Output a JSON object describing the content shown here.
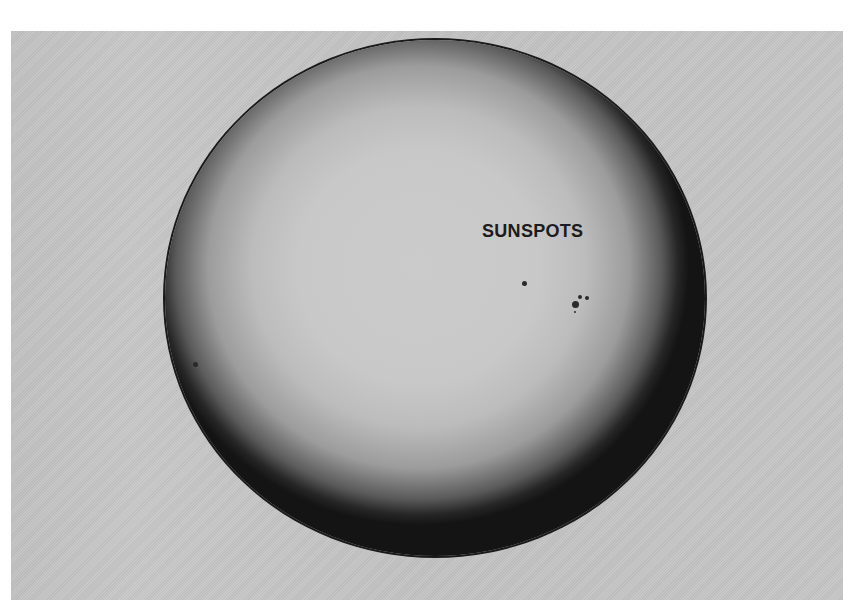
{
  "image": {
    "subject": "Photograph of the solar disk with sunspots",
    "label": "SUNSPOTS",
    "colors": {
      "background": "#c4c4c4",
      "sun_center": "#cbcbcb",
      "limb": "#141414",
      "label": "#1c1c1c"
    },
    "sunspots": [
      {
        "x": 524,
        "y": 283,
        "r": 2.5
      },
      {
        "x": 575,
        "y": 304,
        "r": 3.5
      },
      {
        "x": 580,
        "y": 297,
        "r": 2
      },
      {
        "x": 587,
        "y": 298,
        "r": 2
      },
      {
        "x": 575,
        "y": 312,
        "r": 1.2
      },
      {
        "x": 195,
        "y": 364,
        "r": 2.5
      }
    ]
  }
}
